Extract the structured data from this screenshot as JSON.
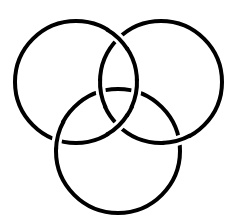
{
  "diagram": {
    "title": "Borromean rings",
    "background": "#ffffff",
    "stroke_color": "#000000",
    "stroke_width": 4,
    "rings": [
      {
        "id": "ring-top-left",
        "cx": 76,
        "cy": 82,
        "r": 61
      },
      {
        "id": "ring-top-right",
        "cx": 161,
        "cy": 82,
        "r": 61
      },
      {
        "id": "ring-bottom",
        "cx": 118,
        "cy": 151,
        "r": 62
      }
    ],
    "crossings": [
      {
        "over": 0,
        "angle": -46,
        "desc": "top-left over top-right (upper)"
      },
      {
        "over": 0,
        "angle": 46,
        "desc": "top-left over top-right (lower)"
      },
      {
        "over": 1,
        "angle": 169,
        "desc": "top-right over bottom (upper left)"
      },
      {
        "over": 1,
        "angle": 75,
        "desc": "top-right over bottom (lower right)"
      },
      {
        "over": 0,
        "angle": 11,
        "desc": "top-left over bottom (upper right)"
      },
      {
        "over": 2,
        "angle": 195,
        "desc": "bottom over top-left (lower left)"
      }
    ]
  }
}
